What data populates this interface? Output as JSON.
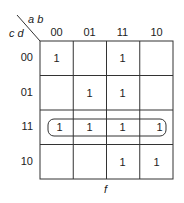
{
  "kmap": {
    "row_var_label": "c d",
    "col_var_label": "a b",
    "col_headers": [
      "00",
      "01",
      "11",
      "10"
    ],
    "row_headers": [
      "00",
      "01",
      "11",
      "10"
    ],
    "cells": [
      [
        "1",
        "",
        "1",
        ""
      ],
      [
        "",
        "1",
        "1",
        ""
      ],
      [
        "1",
        "1",
        "1",
        "1"
      ],
      [
        "",
        "",
        "1",
        "1"
      ]
    ],
    "groupings": [
      {
        "row": "11",
        "cols": [
          "00",
          "01",
          "11",
          "10"
        ],
        "shape": "rounded-rectangle"
      }
    ],
    "function_label": "f"
  }
}
